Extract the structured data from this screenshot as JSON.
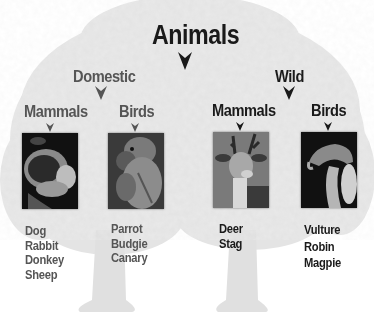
{
  "title": "Animals",
  "colors": {
    "primary_text": "#1a1a1a",
    "domestic_text": "#555555",
    "tree_foliage": "#e6e6e6",
    "background": "#ffffff"
  },
  "branches": {
    "domestic": {
      "label": "Domestic",
      "groups": {
        "mammals": {
          "label": "Mammals",
          "image": "dog-photo",
          "items": [
            "Dog",
            "Rabbit",
            "Donkey",
            "Sheep"
          ]
        },
        "birds": {
          "label": "Birds",
          "image": "parrot-photo",
          "items": [
            "Parrot",
            "Budgie",
            "Canary"
          ]
        }
      }
    },
    "wild": {
      "label": "Wild",
      "groups": {
        "mammals": {
          "label": "Mammals",
          "image": "deer-photo",
          "items": [
            "Deer",
            "Stag"
          ]
        },
        "birds": {
          "label": "Birds",
          "image": "vulture-photo",
          "items": [
            "Vulture",
            "Robin",
            "Magpie"
          ]
        }
      }
    }
  }
}
